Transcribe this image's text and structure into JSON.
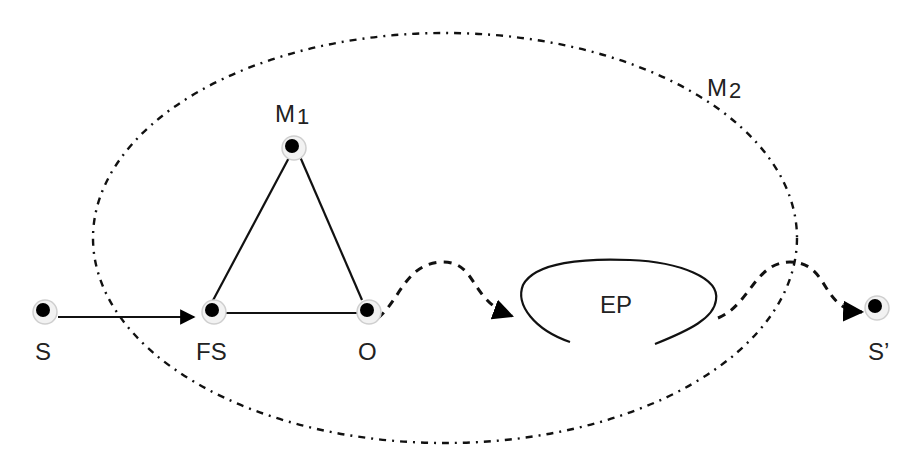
{
  "diagram": {
    "nodes": {
      "S": {
        "label": "S"
      },
      "FS": {
        "label": "FS"
      },
      "O": {
        "label": "O"
      },
      "M1": {
        "label": "M",
        "subscript": "1"
      },
      "S_prime": {
        "label": "S’"
      }
    },
    "regions": {
      "M2": {
        "label": "M",
        "subscript": "2"
      },
      "EP": {
        "label": "EP"
      }
    },
    "edges": [
      {
        "from": "S",
        "to": "FS",
        "style": "solid-arrow"
      },
      {
        "from": "FS",
        "to": "M1",
        "style": "solid"
      },
      {
        "from": "M1",
        "to": "O",
        "style": "solid"
      },
      {
        "from": "FS",
        "to": "O",
        "style": "solid"
      },
      {
        "from": "O",
        "to": "EP",
        "style": "dashed-arrow"
      },
      {
        "from": "EP",
        "to": "S_prime",
        "style": "dashed-arrow"
      }
    ]
  }
}
